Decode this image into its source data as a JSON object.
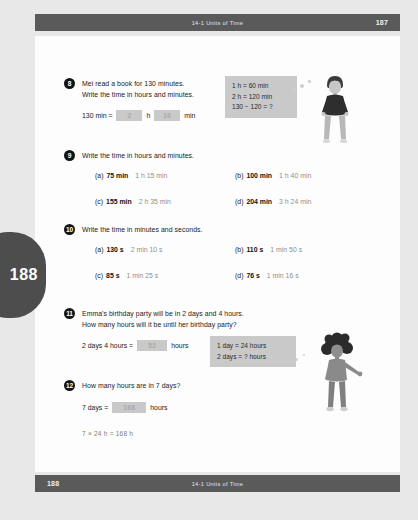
{
  "header": {
    "title": "14-1  Units of Time",
    "page_number": "187"
  },
  "footer": {
    "title": "14-1  Units of Time",
    "page_number": "188"
  },
  "side_tab": {
    "page_number": "188"
  },
  "questions": [
    {
      "number": "8",
      "lines": [
        "Mei read a book for 130 minutes.",
        "Write the time in hours and minutes."
      ],
      "equation": {
        "prefix": "130 min =",
        "answer_1": "2",
        "unit_1": "h",
        "answer_2": "10",
        "unit_2": "min"
      },
      "hint": [
        "1 h = 60 min",
        "2 h = 120 min",
        "130 − 120 = ?"
      ]
    },
    {
      "number": "9",
      "lines": [
        "Write the time in hours and minutes."
      ],
      "parts": [
        {
          "label": "(a)",
          "question": "75 min",
          "answer": "1 h 15 min"
        },
        {
          "label": "(b)",
          "question": "100 min",
          "answer": "1 h 40 min"
        },
        {
          "label": "(c)",
          "question": "155 min",
          "answer": "2 h 35 min"
        },
        {
          "label": "(d)",
          "question": "204 min",
          "answer": "3 h 24 min"
        }
      ]
    },
    {
      "number": "10",
      "lines": [
        "Write the time in minutes and seconds."
      ],
      "parts": [
        {
          "label": "(a)",
          "question": "130 s",
          "answer": "2 min 10 s"
        },
        {
          "label": "(b)",
          "question": "110 s",
          "answer": "1 min 50 s"
        },
        {
          "label": "(c)",
          "question": "85 s",
          "answer": "1 min 25 s"
        },
        {
          "label": "(d)",
          "question": "76 s",
          "answer": "1 min 16 s"
        }
      ]
    },
    {
      "number": "11",
      "lines": [
        "Emma's birthday party will be in 2 days and 4 hours.",
        "How many hours will it be until her birthday party?"
      ],
      "equation": {
        "prefix": "2 days 4 hours =",
        "answer_1": "52",
        "unit_1": "hours"
      },
      "hint": [
        "1 day = 24 hours",
        "2 days = ? hours"
      ]
    },
    {
      "number": "12",
      "lines": [
        "How many hours are in 7 days?"
      ],
      "equation": {
        "prefix": "7 days =",
        "answer_1": "168",
        "unit_1": "hours"
      },
      "working": "7 × 24 h = 168 h"
    }
  ],
  "illustrations": [
    {
      "name": "boy-standing-figure"
    },
    {
      "name": "child-curly-hair-figure"
    }
  ],
  "colors": {
    "bar": "#5a5a5a",
    "answer_box": "#c9c9c9",
    "hint_box": "#c9c9c9",
    "page": "#fdfdfd",
    "backdrop": "#e8e8e8"
  }
}
